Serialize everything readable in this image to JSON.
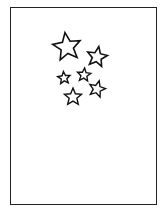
{
  "figure": {
    "frame_color": "#222222",
    "background": "#ffffff",
    "stars": [
      {
        "name": "large-star",
        "cx": 67,
        "cy": 47,
        "r": 14.5,
        "rot": -8
      },
      {
        "name": "top-right-star",
        "cx": 97,
        "cy": 57,
        "r": 10.5,
        "rot": 10
      },
      {
        "name": "small-left-star",
        "cx": 64,
        "cy": 78,
        "r": 6.5,
        "rot": -5
      },
      {
        "name": "small-middle-star",
        "cx": 84,
        "cy": 75,
        "r": 7,
        "rot": 5
      },
      {
        "name": "right-star",
        "cx": 97,
        "cy": 89,
        "r": 8.5,
        "rot": 15
      },
      {
        "name": "bottom-star",
        "cx": 73,
        "cy": 97,
        "r": 9,
        "rot": 0
      }
    ]
  }
}
